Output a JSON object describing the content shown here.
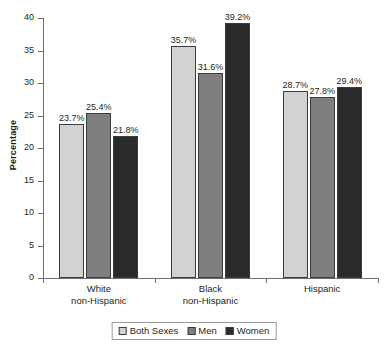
{
  "chart_data": {
    "type": "bar",
    "title": "",
    "subtitle": "",
    "xlabel": "",
    "ylabel": "Percentage",
    "ylim": [
      0,
      40
    ],
    "ytick_labels": [
      "0",
      "5",
      "10",
      "15",
      "20",
      "25",
      "30",
      "35",
      "40"
    ],
    "ytick_values": [
      0,
      5,
      10,
      15,
      20,
      25,
      30,
      35,
      40
    ],
    "grid": false,
    "legend_position": "bottom-center",
    "categories": [
      "White non-Hispanic",
      "Black non-Hispanic",
      "Hispanic"
    ],
    "category_lines": [
      [
        "White",
        "non-Hispanic"
      ],
      [
        "Black",
        "non-Hispanic"
      ],
      [
        "Hispanic",
        ""
      ]
    ],
    "series": [
      {
        "name": "Both Sexes",
        "color": "#d2d2d2",
        "values": [
          23.7,
          25.4,
          21.8
        ],
        "labels": [
          "23.7%",
          "25.4%",
          "21.8%"
        ]
      },
      {
        "name": "Men",
        "color": "#7e7e7e",
        "values": [
          35.7,
          31.6,
          39.2
        ],
        "labels": [
          "35.7%",
          "31.6%",
          "39.2%"
        ]
      },
      {
        "name": "Women",
        "color": "#2a2a2a",
        "values": [
          28.7,
          27.8,
          29.4
        ],
        "labels": [
          "28.7%",
          "27.8%",
          "29.4%"
        ]
      }
    ],
    "groups": [
      {
        "category": "White non-Hispanic",
        "bars": [
          {
            "series": "Both Sexes",
            "value": 23.7,
            "label": "23.7%",
            "color": "#d2d2d2"
          },
          {
            "series": "Men",
            "value": 25.4,
            "label": "25.4%",
            "color": "#7e7e7e"
          },
          {
            "series": "Women",
            "value": 21.8,
            "label": "21.8%",
            "color": "#2a2a2a"
          }
        ]
      },
      {
        "category": "Black non-Hispanic",
        "bars": [
          {
            "series": "Both Sexes",
            "value": 35.7,
            "label": "35.7%",
            "color": "#d2d2d2"
          },
          {
            "series": "Men",
            "value": 31.6,
            "label": "31.6%",
            "color": "#7e7e7e"
          },
          {
            "series": "Women",
            "value": 39.2,
            "label": "39.2%",
            "color": "#2a2a2a"
          }
        ]
      },
      {
        "category": "Hispanic",
        "bars": [
          {
            "series": "Both Sexes",
            "value": 28.7,
            "label": "28.7%",
            "color": "#d2d2d2"
          },
          {
            "series": "Men",
            "value": 27.8,
            "label": "27.8%",
            "color": "#7e7e7e"
          },
          {
            "series": "Women",
            "value": 29.4,
            "label": "29.4%",
            "color": "#2a2a2a"
          }
        ]
      }
    ],
    "legend": [
      {
        "label": "Both Sexes",
        "color": "#d2d2d2"
      },
      {
        "label": "Men",
        "color": "#7e7e7e"
      },
      {
        "label": "Women",
        "color": "#2a2a2a"
      }
    ],
    "axis_color": "#6f6f6f",
    "bar_outline_color": "#3c3c3c",
    "background": "#ffffff"
  }
}
